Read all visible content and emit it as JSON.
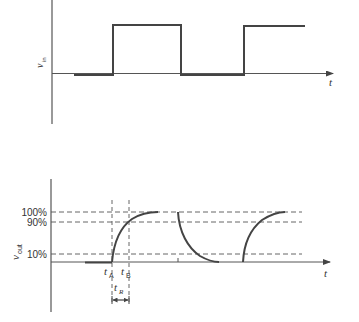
{
  "diagram": {
    "colors": {
      "stroke": "#444444",
      "axis": "#555555",
      "dashed": "#555555",
      "text": "#333333",
      "background": "#ffffff"
    },
    "top_plot": {
      "y_label_main": "v",
      "y_label_sub": "in",
      "x_label": "t",
      "waveform": "square",
      "edges": [
        "rise",
        "fall",
        "rise"
      ]
    },
    "bottom_plot": {
      "y_label_main": "v",
      "y_label_sub": "out",
      "x_label": "t",
      "levels": [
        {
          "label": "100%"
        },
        {
          "label": "90%"
        },
        {
          "label": "10%"
        }
      ],
      "markers": {
        "t_a_main": "t",
        "t_a_sub": "A",
        "t_b_main": "t",
        "t_b_sub": "B",
        "t_r_main": "t",
        "t_r_sub": "R"
      },
      "waveform": "exponential-rise-decay"
    }
  }
}
